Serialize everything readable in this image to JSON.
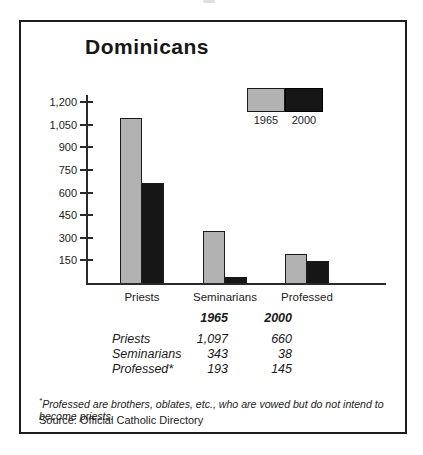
{
  "title": "Dominicans",
  "colors": {
    "bar_1965": "#b2b2b2",
    "bar_2000": "#161616",
    "axis": "#2a2a2a",
    "frame_border": "#1c1c1c",
    "background": "#ffffff"
  },
  "chart_data": {
    "type": "bar",
    "title": "Dominicans",
    "categories": [
      "Priests",
      "Seminarians",
      "Professed"
    ],
    "series": [
      {
        "name": "1965",
        "color": "#b2b2b2",
        "values": [
          1097,
          343,
          193
        ]
      },
      {
        "name": "2000",
        "color": "#161616",
        "values": [
          660,
          38,
          145
        ]
      }
    ],
    "ylim": [
      0,
      1200
    ],
    "yticks": [
      150,
      300,
      450,
      600,
      750,
      900,
      1050,
      1200
    ],
    "ytick_labels": [
      "150",
      "300",
      "450",
      "600",
      "750",
      "900",
      "1,050",
      "1,200"
    ],
    "grid": false,
    "legend_position": "top-right"
  },
  "legend": {
    "labels": [
      "1965",
      "2000"
    ]
  },
  "table": {
    "col_headers": [
      "1965",
      "2000"
    ],
    "rows": [
      {
        "label": "Priests",
        "v1965": "1,097",
        "v2000": "660"
      },
      {
        "label": "Seminarians",
        "v1965": "343",
        "v2000": "38"
      },
      {
        "label": "Professed*",
        "v1965": "193",
        "v2000": "145"
      }
    ]
  },
  "footnote": {
    "asterisk": "*",
    "text": "Professed are brothers, oblates, etc., who are vowed but do not intend to become priests."
  },
  "source": "Source: Official Catholic Directory"
}
